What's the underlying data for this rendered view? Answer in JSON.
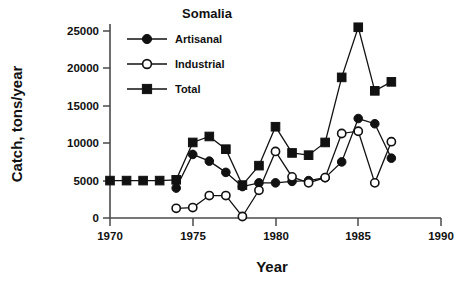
{
  "chart_data": {
    "type": "line",
    "title": "Somalia",
    "xlabel": "Year",
    "ylabel": "Catch, tons/year",
    "xlim": [
      1970,
      1990
    ],
    "ylim": [
      0,
      27000
    ],
    "xticks": [
      1970,
      1975,
      1980,
      1985,
      1990
    ],
    "yticks": [
      0,
      5000,
      10000,
      15000,
      20000,
      25000
    ],
    "grid": false,
    "legend_position": "top-left-inside",
    "series": [
      {
        "name": "Artisanal",
        "marker": "filled-circle",
        "x": [
          1974,
          1975,
          1976,
          1977,
          1978,
          1979,
          1980,
          1981,
          1982,
          1983,
          1984,
          1985,
          1986,
          1987
        ],
        "values": [
          4000,
          8500,
          7600,
          6100,
          4200,
          4700,
          4700,
          4900,
          5000,
          5400,
          7500,
          13300,
          12600,
          8000
        ]
      },
      {
        "name": "Industrial",
        "marker": "open-circle",
        "x": [
          1974,
          1975,
          1976,
          1977,
          1978,
          1979,
          1980,
          1981,
          1982,
          1983,
          1984,
          1985,
          1986,
          1987
        ],
        "values": [
          1300,
          1400,
          3000,
          3000,
          200,
          3700,
          8900,
          5500,
          4700,
          5400,
          11300,
          11600,
          4700,
          10200
        ]
      },
      {
        "name": "Total",
        "marker": "filled-square",
        "x": [
          1970,
          1971,
          1972,
          1973,
          1974,
          1975,
          1976,
          1977,
          1978,
          1979,
          1980,
          1981,
          1982,
          1983,
          1984,
          1985,
          1986,
          1987
        ],
        "values": [
          5000,
          5000,
          5000,
          5000,
          5100,
          10100,
          10900,
          9200,
          4400,
          7000,
          12200,
          8700,
          8400,
          10100,
          18800,
          25500,
          17000,
          18200
        ]
      }
    ],
    "colors": {
      "ink": "#111111",
      "axis": "#4a4a4a",
      "background": "#ffffff"
    }
  },
  "legend": {
    "items": [
      {
        "label": "Artisanal",
        "marker": "filled-circle"
      },
      {
        "label": "Industrial",
        "marker": "open-circle"
      },
      {
        "label": "Total",
        "marker": "filled-square"
      }
    ]
  },
  "axes": {
    "x_tick_labels": [
      "1970",
      "1975",
      "1980",
      "1985",
      "1990"
    ],
    "y_tick_labels": [
      "0",
      "5000",
      "10000",
      "15000",
      "20000",
      "25000"
    ]
  }
}
